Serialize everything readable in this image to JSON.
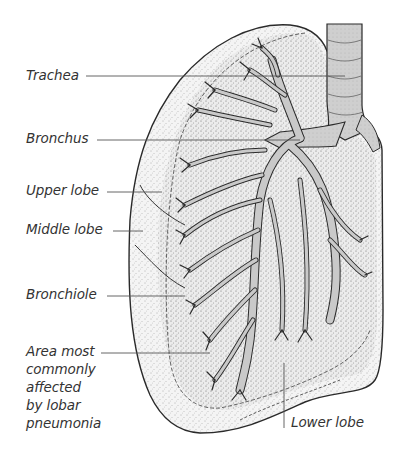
{
  "diagram": {
    "colors": {
      "outline": "#2a2a2a",
      "fill_light": "#f2f2f2",
      "airway_fill": "#c8c8c8",
      "leader_line": "#555555",
      "label_text": "#333333"
    },
    "labels": {
      "trachea": "Trachea",
      "bronchus": "Bronchus",
      "upper_lobe": "Upper lobe",
      "middle_lobe": "Middle lobe",
      "bronchiole": "Bronchiole",
      "area_pneumonia": "Area most\ncommonly\naffected\nby lobar\npneumonia",
      "lower_lobe": "Lower lobe"
    }
  }
}
